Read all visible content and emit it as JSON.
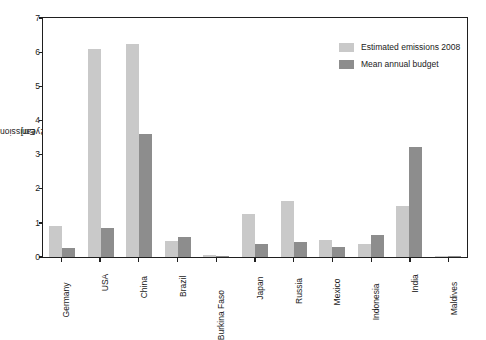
{
  "chart_data": {
    "type": "bar",
    "title": "",
    "xlabel": "",
    "ylabel": "Emissions [Gt CO2 per year]",
    "ylabel_prefix": "Emissions [Gt CO",
    "ylabel_sub": "2",
    "ylabel_suffix": " per year]",
    "ylim": [
      0,
      7
    ],
    "yticks": [
      0,
      1,
      2,
      3,
      4,
      5,
      6,
      7
    ],
    "ytick_labels": [
      "0",
      "1",
      "2",
      "3",
      "4",
      "5",
      "6",
      "7"
    ],
    "grid": false,
    "legend_position": "top-right",
    "categories": [
      "Germany",
      "USA",
      "China",
      "Brazil",
      "Burkina Faso",
      "Japan",
      "Russia",
      "Mexico",
      "Indonesia",
      "India",
      "Maldives"
    ],
    "series": [
      {
        "name": "Estimated emissions 2008",
        "color": "#c9c9c9",
        "values": [
          0.9,
          6.1,
          6.25,
          0.48,
          0.06,
          1.25,
          1.65,
          0.5,
          0.38,
          1.48,
          0.02
        ]
      },
      {
        "name": "Mean annual budget",
        "color": "#8d8d8d",
        "values": [
          0.25,
          0.85,
          3.6,
          0.58,
          0.04,
          0.38,
          0.45,
          0.3,
          0.65,
          3.22,
          0.03
        ]
      }
    ]
  },
  "legend": {
    "items": [
      {
        "label": "Estimated emissions 2008",
        "color": "#c9c9c9"
      },
      {
        "label": "Mean annual budget",
        "color": "#8d8d8d"
      }
    ]
  },
  "colors": {
    "axis": "#1f1f1f",
    "text": "#1a1a1a",
    "background": "#ffffff",
    "series_light": "#c9c9c9",
    "series_dark": "#8d8d8d"
  }
}
